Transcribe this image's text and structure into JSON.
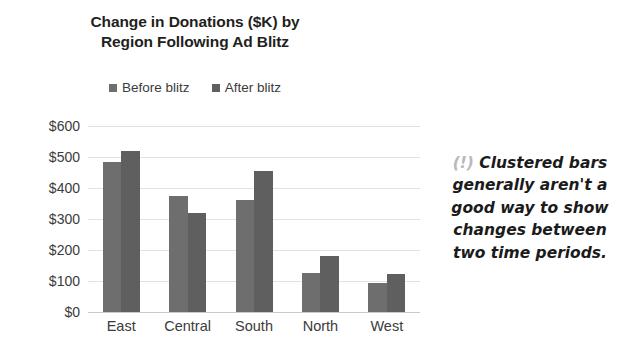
{
  "chart_data": {
    "type": "bar",
    "title": "Change in Donations ($K) by Region Following Ad Blitz",
    "title_line1": "Change in Donations ($K) by",
    "title_line2": "Region Following Ad Blitz",
    "xlabel": "",
    "ylabel": "",
    "categories": [
      "East",
      "Central",
      "South",
      "North",
      "West"
    ],
    "series": [
      {
        "name": "Before blitz",
        "values": [
          484,
          374,
          360,
          125,
          95
        ],
        "color": "#6e6e6e"
      },
      {
        "name": "After blitz",
        "values": [
          519,
          320,
          456,
          180,
          122
        ],
        "color": "#5f5f5f"
      }
    ],
    "ylim": [
      0,
      600
    ],
    "ytick_values": [
      600,
      500,
      400,
      300,
      200,
      100,
      0
    ],
    "ytick_labels": [
      "$600",
      "$500",
      "$400",
      "$300",
      "$200",
      "$100",
      "$0"
    ],
    "grid": true,
    "legend_position": "top-center"
  },
  "annotation": {
    "marker": "(!)",
    "text": "Clustered bars generally aren't a good way to show changes between two time periods.",
    "lines": [
      "Clustered bars",
      "generally aren't a",
      "good way to show",
      "changes between",
      "two time periods."
    ],
    "marker_color": "#b9b9b9"
  },
  "colors": {
    "background": "#ffffff",
    "text": "#3b3b3b",
    "title": "#231f20",
    "gridline": "#e2e2e2",
    "axis": "#c9c9c9",
    "series_1": "#6e6e6e",
    "series_2": "#5f5f5f"
  }
}
